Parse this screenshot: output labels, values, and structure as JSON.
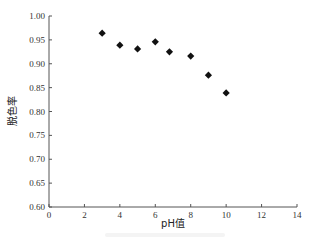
{
  "chart_data": {
    "type": "scatter",
    "title": "",
    "xlabel": "pH值",
    "ylabel": "脱色率",
    "xlim": [
      0,
      14
    ],
    "ylim": [
      0.6,
      1.0
    ],
    "x_ticks": [
      0,
      2,
      4,
      6,
      8,
      10,
      12,
      14
    ],
    "y_ticks": [
      0.6,
      0.65,
      0.7,
      0.75,
      0.8,
      0.85,
      0.9,
      0.95,
      1.0
    ],
    "x_tick_labels": [
      "0",
      "2",
      "4",
      "6",
      "8",
      "10",
      "12",
      "14"
    ],
    "y_tick_labels": [
      "0.60",
      "0.65",
      "0.70",
      "0.75",
      "0.80",
      "0.85",
      "0.90",
      "0.95",
      "1.00"
    ],
    "grid": false,
    "legend": null,
    "marker": "diamond",
    "marker_color": "#111111",
    "series": [
      {
        "name": "脱色率",
        "x": [
          3,
          4,
          5,
          6,
          6.8,
          8,
          9,
          10
        ],
        "y": [
          0.964,
          0.939,
          0.931,
          0.946,
          0.925,
          0.916,
          0.876,
          0.839
        ]
      }
    ]
  }
}
